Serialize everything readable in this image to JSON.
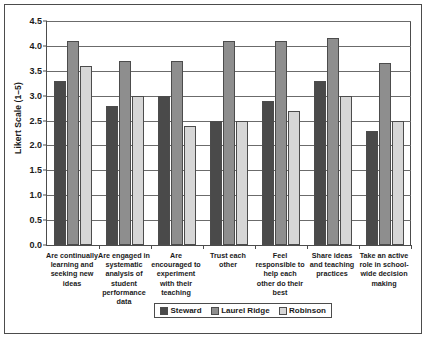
{
  "chart_data": {
    "type": "bar",
    "title": "",
    "xlabel": "",
    "ylabel": "Likert Scale (1–5)",
    "ylim": [
      0.0,
      4.5
    ],
    "ytick_labels": [
      "0.0",
      "0.5",
      "1.0",
      "1.5",
      "2.0",
      "2.5",
      "3.0",
      "3.5",
      "4.0",
      "4.5"
    ],
    "ytick_values": [
      0.0,
      0.5,
      1.0,
      1.5,
      2.0,
      2.5,
      3.0,
      3.5,
      4.0,
      4.5
    ],
    "grid": true,
    "legend_position": "bottom",
    "categories": [
      "Are continually learning and seeking new ideas",
      "Are engaged in systematic analysis of student performance data",
      "Are encouraged to experiment with their teaching",
      "Trust each other",
      "Feel responsible to help each other do their best",
      "Share ideas and teaching practices",
      "Take an active role in school-wide decision making"
    ],
    "series": [
      {
        "name": "Steward",
        "color": "#4a4a4a",
        "values": [
          3.3,
          2.8,
          3.0,
          2.5,
          2.9,
          3.3,
          2.3
        ]
      },
      {
        "name": "Laurel Ridge",
        "color": "#8e8e8e",
        "values": [
          4.1,
          3.7,
          3.7,
          4.1,
          4.1,
          4.15,
          3.65
        ]
      },
      {
        "name": "Robinson",
        "color": "#d6d6d6",
        "values": [
          3.6,
          3.0,
          2.4,
          2.5,
          2.7,
          3.0,
          2.5
        ]
      }
    ]
  },
  "legend": {
    "items": [
      {
        "label": "Steward"
      },
      {
        "label": "Laurel Ridge"
      },
      {
        "label": "Robinson"
      }
    ]
  }
}
